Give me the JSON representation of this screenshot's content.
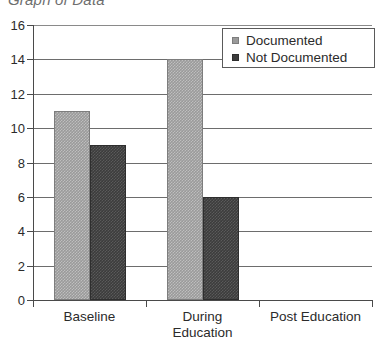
{
  "chart_data": {
    "type": "bar",
    "title": "Graph of Data",
    "xlabel": "",
    "ylabel": "",
    "ylim": [
      0,
      16
    ],
    "ytick_step": 2,
    "yticks": [
      "0",
      "2",
      "4",
      "6",
      "8",
      "10",
      "12",
      "14",
      "16"
    ],
    "grid": true,
    "legend_position": "upper right",
    "categories": [
      "Baseline",
      "During\nEducation",
      "Post Education"
    ],
    "series": [
      {
        "name": "Documented",
        "color": "#9a9a9a",
        "values": [
          11,
          14,
          0
        ]
      },
      {
        "name": "Not Documented",
        "color": "#3c3c3c",
        "values": [
          9,
          6,
          0
        ]
      }
    ]
  },
  "legend": {
    "items": [
      {
        "label": "Documented"
      },
      {
        "label": "Not Documented"
      }
    ]
  },
  "axis": {
    "y_labels": [
      "16",
      "14",
      "12",
      "10",
      "8",
      "6",
      "4",
      "2",
      "0"
    ]
  },
  "categories_display": [
    "Baseline",
    "During\nEducation",
    "Post Education"
  ]
}
